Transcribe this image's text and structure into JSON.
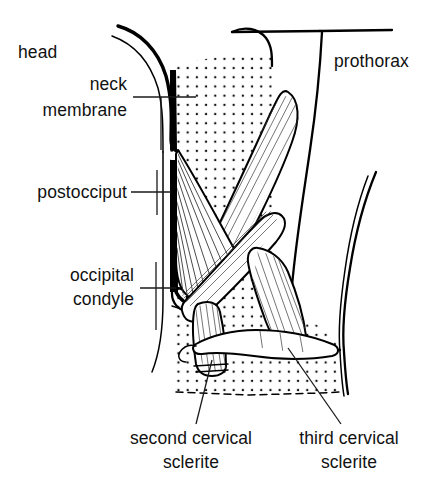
{
  "figure": {
    "background_color": "#ffffff",
    "ink_color": "#000000",
    "width": 446,
    "height": 493
  },
  "labels": {
    "head": "head",
    "neck_membrane_line1": "neck",
    "neck_membrane_line2": "membrane",
    "postocciput": "postocciput",
    "occipital_condyle_line1": "occipital",
    "occipital_condyle_line2": "condyle",
    "prothorax": "prothorax",
    "second_cervical_sclerite_line1": "second cervical",
    "second_cervical_sclerite_line2": "sclerite",
    "third_cervical_sclerite_line1": "third cervical",
    "third_cervical_sclerite_line2": "sclerite"
  },
  "structures": {
    "stipple_region_name": "neck membrane stippled area",
    "muscle_group_name": "cervical muscles",
    "head_capsule_name": "head capsule outline",
    "prothorax_name": "prothorax outline"
  }
}
